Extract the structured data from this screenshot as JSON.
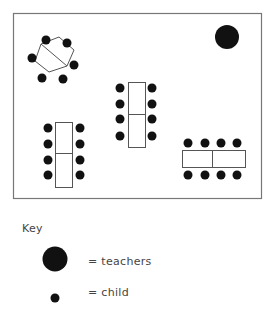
{
  "diagram": {
    "room": {
      "x": 13,
      "y": 13,
      "width": 248,
      "height": 185,
      "border_color": "#777777"
    },
    "colors": {
      "dot": "#111111",
      "table_stroke": "#555555",
      "table_fill": "#ffffff"
    },
    "teacher": {
      "cx": 227,
      "cy": 37,
      "r": 12
    },
    "tables": [
      {
        "id": "hexagon-table",
        "shape": "hexagon",
        "points": "41,44 59,37 74,50 67,66 49,72 35,61",
        "divider": [
          41,
          44,
          67,
          66
        ],
        "children": [
          [
            46,
            40
          ],
          [
            67,
            43
          ],
          [
            32,
            58
          ],
          [
            74,
            65
          ],
          [
            42,
            78
          ],
          [
            63,
            79
          ]
        ]
      },
      {
        "id": "center-table",
        "shape": "rect",
        "rect": [
          128,
          82,
          17,
          65
        ],
        "divider": [
          128,
          114,
          145,
          114
        ],
        "children": [
          [
            120,
            88
          ],
          [
            120,
            104
          ],
          [
            120,
            119
          ],
          [
            120,
            136
          ],
          [
            152,
            88
          ],
          [
            152,
            104
          ],
          [
            152,
            119
          ],
          [
            152,
            136
          ]
        ]
      },
      {
        "id": "bottom-left-table",
        "shape": "rect",
        "rect": [
          55,
          122,
          17,
          65
        ],
        "divider": [
          55,
          153,
          72,
          153
        ],
        "children": [
          [
            48,
            128
          ],
          [
            48,
            144
          ],
          [
            48,
            160
          ],
          [
            48,
            175
          ],
          [
            80,
            128
          ],
          [
            80,
            144
          ],
          [
            80,
            160
          ],
          [
            80,
            175
          ]
        ]
      },
      {
        "id": "right-table",
        "shape": "rect",
        "rect": [
          182,
          150,
          63,
          17
        ],
        "divider": [
          212,
          150,
          212,
          167
        ],
        "children": [
          [
            188,
            143
          ],
          [
            205,
            143
          ],
          [
            221,
            143
          ],
          [
            237,
            143
          ],
          [
            188,
            175
          ],
          [
            205,
            175
          ],
          [
            221,
            175
          ],
          [
            237,
            175
          ]
        ]
      }
    ],
    "child_radius": 4.5
  },
  "key": {
    "title": "Key",
    "teacher_label": "= teachers",
    "child_label": "= child"
  }
}
